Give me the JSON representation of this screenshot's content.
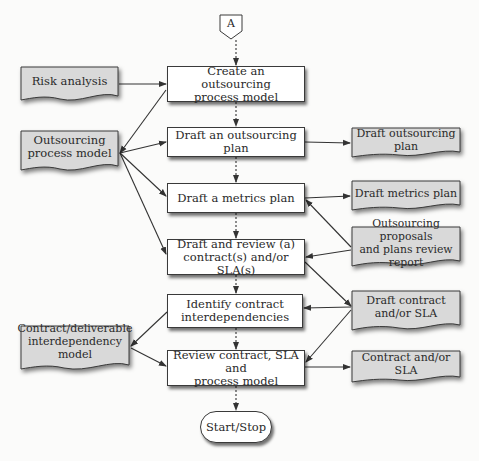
{
  "diagram": {
    "type": "flowchart",
    "start_connector": {
      "label": "A"
    },
    "process_steps": [
      {
        "id": "p1",
        "label_line1": "Create an outsourcing",
        "label_line2": "process model"
      },
      {
        "id": "p2",
        "label_line1": "Draft an outsourcing plan",
        "label_line2": ""
      },
      {
        "id": "p3",
        "label_line1": "Draft a metrics plan",
        "label_line2": ""
      },
      {
        "id": "p4",
        "label_line1": "Draft and review (a)",
        "label_line2": "contract(s) and/or SLA(s)"
      },
      {
        "id": "p5",
        "label_line1": "Identify contract",
        "label_line2": "interdependencies"
      },
      {
        "id": "p6",
        "label_line1": "Review contract, SLA and",
        "label_line2": "process model"
      }
    ],
    "terminal": {
      "label": "Start/Stop"
    },
    "input_documents": [
      {
        "id": "d_risk",
        "label_line1": "Risk analysis",
        "label_line2": ""
      },
      {
        "id": "d_opm",
        "label_line1": "Outsourcing",
        "label_line2": "process model"
      },
      {
        "id": "d_cdim",
        "label_line1": "Contract/deliverable",
        "label_line2": "interdependency model"
      }
    ],
    "output_documents": [
      {
        "id": "o_plan",
        "label_line1": "Draft outsourcing plan",
        "label_line2": ""
      },
      {
        "id": "o_metrics",
        "label_line1": "Draft metrics plan",
        "label_line2": ""
      },
      {
        "id": "o_review",
        "label_line1": "Outsourcing proposals",
        "label_line2": "and plans review report"
      },
      {
        "id": "o_contract",
        "label_line1": "Draft contract",
        "label_line2": "and/or SLA"
      },
      {
        "id": "o_final",
        "label_line1": "Contract and/or SLA",
        "label_line2": ""
      }
    ],
    "edges": [
      {
        "from": "A",
        "to": "p1",
        "style": "dotted"
      },
      {
        "from": "p1",
        "to": "p2",
        "style": "dotted"
      },
      {
        "from": "p2",
        "to": "p3",
        "style": "dotted"
      },
      {
        "from": "p3",
        "to": "p4",
        "style": "dotted"
      },
      {
        "from": "p4",
        "to": "p5",
        "style": "dotted"
      },
      {
        "from": "p5",
        "to": "p6",
        "style": "dotted"
      },
      {
        "from": "p6",
        "to": "terminal",
        "style": "dotted"
      },
      {
        "from": "d_risk",
        "to": "p1",
        "style": "solid"
      },
      {
        "from": "p1",
        "to": "d_opm",
        "style": "solid"
      },
      {
        "from": "d_opm",
        "to": "p2",
        "style": "solid"
      },
      {
        "from": "d_opm",
        "to": "p3",
        "style": "solid"
      },
      {
        "from": "d_opm",
        "to": "p4",
        "style": "solid"
      },
      {
        "from": "p2",
        "to": "o_plan",
        "style": "solid"
      },
      {
        "from": "p3",
        "to": "o_metrics",
        "style": "solid"
      },
      {
        "from": "o_review",
        "to": "p3",
        "style": "solid"
      },
      {
        "from": "o_review",
        "to": "p4",
        "style": "solid"
      },
      {
        "from": "p4",
        "to": "o_contract",
        "style": "solid"
      },
      {
        "from": "o_contract",
        "to": "p5",
        "style": "solid"
      },
      {
        "from": "o_contract",
        "to": "p6",
        "style": "solid"
      },
      {
        "from": "p5",
        "to": "d_cdim",
        "style": "solid"
      },
      {
        "from": "d_cdim",
        "to": "p6",
        "style": "solid"
      },
      {
        "from": "p6",
        "to": "o_final",
        "style": "solid"
      }
    ],
    "colors": {
      "document_fill": "#d9d9d9",
      "process_fill": "#ffffff",
      "stroke": "#3a3a3a"
    }
  }
}
